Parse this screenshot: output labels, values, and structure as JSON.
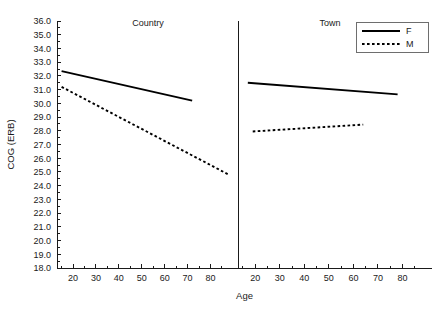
{
  "chart_data": {
    "type": "line",
    "title": "",
    "xlabel": "Age",
    "ylabel": "COG (ERB)",
    "xlim": [
      13,
      92
    ],
    "ylim": [
      18.0,
      36.0
    ],
    "grid": false,
    "legend_position": "top-right",
    "y_ticks": [
      "36.0",
      "35.0",
      "34.0",
      "33.0",
      "32.0",
      "31.0",
      "30.0",
      "29.0",
      "28.0",
      "27.0",
      "26.0",
      "25.0",
      "24.0",
      "23.0",
      "22.0",
      "21.0",
      "20.0",
      "19.0",
      "18.0"
    ],
    "y_tick_values": [
      36.0,
      35.0,
      34.0,
      33.0,
      32.0,
      31.0,
      30.0,
      29.0,
      28.0,
      27.0,
      26.0,
      25.0,
      24.0,
      23.0,
      22.0,
      21.0,
      20.0,
      19.0,
      18.0
    ],
    "x_ticks": [
      "20",
      "30",
      "40",
      "50",
      "60",
      "70",
      "80"
    ],
    "x_tick_values": [
      20,
      30,
      40,
      50,
      60,
      70,
      80
    ],
    "x_minor_step": 5,
    "legend": [
      {
        "name": "F",
        "style": "solid"
      },
      {
        "name": "M",
        "style": "dashed"
      }
    ],
    "panels": [
      {
        "label": "Country",
        "series": [
          {
            "name": "F",
            "style": "solid",
            "x": [
              15,
              72
            ],
            "y": [
              32.35,
              30.2
            ]
          },
          {
            "name": "M",
            "style": "dashed",
            "x": [
              15,
              88
            ],
            "y": [
              31.2,
              24.8
            ]
          }
        ]
      },
      {
        "label": "Town",
        "series": [
          {
            "name": "F",
            "style": "solid",
            "x": [
              17,
              78
            ],
            "y": [
              31.5,
              30.65
            ]
          },
          {
            "name": "M",
            "style": "dashed",
            "x": [
              19,
              64
            ],
            "y": [
              27.95,
              28.45
            ]
          }
        ]
      }
    ],
    "colors": {
      "series_f": "#000000",
      "series_m": "#000000",
      "axis": "#1a1a1a",
      "background": "#ffffff"
    }
  }
}
